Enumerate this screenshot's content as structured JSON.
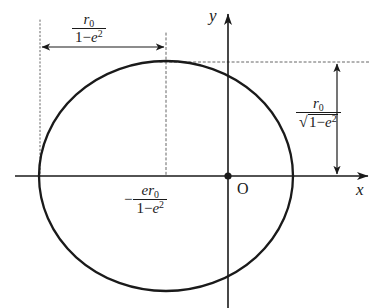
{
  "figure": {
    "background_color": "#ffffff",
    "stroke_color": "#1a1a1a",
    "guide_color": "#555555"
  },
  "axes": {
    "x_label": "x",
    "y_label": "y",
    "origin_label": "O",
    "origin": {
      "x": 228,
      "y": 176
    },
    "x_axis": {
      "start_x": 15,
      "end_x": 370,
      "y": 176
    },
    "y_axis": {
      "x": 228,
      "start_y": 12,
      "end_y": 308
    }
  },
  "curve": {
    "name": "ellipse",
    "center": {
      "x": 166,
      "y": 176
    },
    "semi_major_x": 127,
    "semi_minor_y": 115
  },
  "labels": {
    "semi_major": {
      "numerator": "r",
      "numerator_sub": "0",
      "denominator_lead": "1",
      "denominator_minus": "−",
      "denominator_var": "e",
      "denominator_exp": "2"
    },
    "semi_minor": {
      "numerator": "r",
      "numerator_sub": "0",
      "radical_glyph": "√",
      "denominator_lead": "1",
      "denominator_minus": "−",
      "denominator_var": "e",
      "denominator_exp": "2"
    },
    "center_offset": {
      "sign": "−",
      "numerator_e": "e",
      "numerator_r": "r",
      "numerator_sub": "0",
      "denominator_lead": "1",
      "denominator_minus": "−",
      "denominator_var": "e",
      "denominator_exp": "2"
    }
  },
  "guides": {
    "left_vertical_dotted": {
      "x": 40,
      "top_y": 20,
      "bottom_y": 176
    },
    "center_vertical_dashed": {
      "x": 166,
      "top_y": 33,
      "bottom_y": 176
    },
    "top_horizontal_dotted": {
      "y": 62,
      "start_x": 180,
      "end_x": 370
    },
    "horizontal_measure_arrow": {
      "y": 47,
      "start_x": 40,
      "end_x": 166
    },
    "vertical_measure_arrow": {
      "x": 337,
      "top_y": 62,
      "bottom_y": 176
    }
  }
}
